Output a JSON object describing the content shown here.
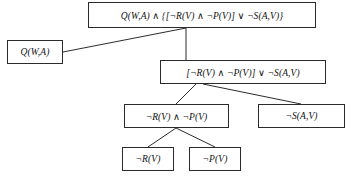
{
  "diagram": {
    "type": "tree",
    "background_color": "#ffffff",
    "line_color": "#2b2b2b",
    "box_border_color": "#2b2b2b",
    "text_color": "#111111",
    "nodes": [
      {
        "id": "root",
        "label": "Q(W,A) ∧ {[¬R(V) ∧ ¬P(V)] ∨ ¬S(A,V)}",
        "level": 0,
        "x": 88,
        "y": 2,
        "w": 228,
        "h": 26
      },
      {
        "id": "left-conjunct",
        "label": "Q(W,A)",
        "level": 1,
        "x": 7,
        "y": 40,
        "w": 56,
        "h": 24
      },
      {
        "id": "right-conjunct",
        "label": "[¬R(V) ∧ ¬P(V)] ∨ ¬S(A,V)",
        "level": 1,
        "x": 160,
        "y": 60,
        "w": 166,
        "h": 24
      },
      {
        "id": "left-disjunct",
        "label": "¬R(V) ∧ ¬P(V)",
        "level": 2,
        "x": 124,
        "y": 104,
        "w": 105,
        "h": 24
      },
      {
        "id": "right-disjunct",
        "label": "¬S(A,V)",
        "level": 2,
        "x": 258,
        "y": 104,
        "w": 87,
        "h": 24
      },
      {
        "id": "leaf-r",
        "label": "¬R(V)",
        "level": 3,
        "x": 122,
        "y": 147,
        "w": 52,
        "h": 24
      },
      {
        "id": "leaf-p",
        "label": "¬P(V)",
        "level": 3,
        "x": 189,
        "y": 147,
        "w": 52,
        "h": 24
      }
    ],
    "edges": [
      {
        "id": "edge-root-left",
        "from": "root",
        "to": "left-conjunct",
        "x1": 186,
        "y1": 28,
        "x2": 63,
        "y2": 52
      },
      {
        "id": "edge-root-right",
        "from": "root",
        "to": "right-conjunct",
        "x1": 186,
        "y1": 28,
        "x2": 186,
        "y2": 60
      },
      {
        "id": "edge-right-leftdisj",
        "from": "right-conjunct",
        "to": "left-disjunct",
        "x1": 196,
        "y1": 84,
        "x2": 176,
        "y2": 104
      },
      {
        "id": "edge-right-rightdisj",
        "from": "right-conjunct",
        "to": "right-disjunct",
        "x1": 203,
        "y1": 84,
        "x2": 301,
        "y2": 104
      },
      {
        "id": "edge-leftdisj-leafr",
        "from": "left-disjunct",
        "to": "leaf-r",
        "x1": 176,
        "y1": 128,
        "x2": 148,
        "y2": 147
      },
      {
        "id": "edge-leftdisj-leafp",
        "from": "left-disjunct",
        "to": "leaf-p",
        "x1": 176,
        "y1": 128,
        "x2": 215,
        "y2": 147
      }
    ]
  }
}
